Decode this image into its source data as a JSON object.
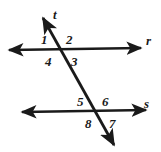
{
  "figure": {
    "kind": "geometry-diagram",
    "background_color": "#ffffff",
    "stroke_color": "#1a1a1a",
    "stroke_width": 2.6,
    "width": 161,
    "height": 152
  },
  "lines": [
    {
      "name": "line-r",
      "label": "r",
      "label_x": 146,
      "label_y": 34,
      "x1": 9,
      "y1": 50,
      "x2": 141,
      "y2": 48,
      "arrow_start": true,
      "arrow_end": true
    },
    {
      "name": "line-s",
      "label": "s",
      "label_x": 144,
      "label_y": 97,
      "x1": 22,
      "y1": 112,
      "x2": 146,
      "y2": 110,
      "arrow_start": true,
      "arrow_end": true
    },
    {
      "name": "line-t",
      "label": "t",
      "label_x": 53,
      "label_y": 8,
      "x1": 43,
      "y1": 18,
      "x2": 114,
      "y2": 145,
      "arrow_start": true,
      "arrow_end": true
    }
  ],
  "intersections": [
    {
      "name": "intersection-r-t",
      "x": 60,
      "y": 49
    },
    {
      "name": "intersection-s-t",
      "x": 97,
      "y": 111
    }
  ],
  "angles": [
    {
      "id": "1",
      "label": "1",
      "x": 41,
      "y": 33,
      "position": "upper-left-of-top-intersection"
    },
    {
      "id": "2",
      "label": "2",
      "x": 66,
      "y": 33,
      "position": "upper-right-of-top-intersection"
    },
    {
      "id": "3",
      "label": "3",
      "x": 71,
      "y": 55,
      "position": "lower-right-of-top-intersection"
    },
    {
      "id": "4",
      "label": "4",
      "x": 45,
      "y": 55,
      "position": "lower-left-of-top-intersection"
    },
    {
      "id": "5",
      "label": "5",
      "x": 77,
      "y": 95,
      "position": "upper-left-of-bottom-intersection"
    },
    {
      "id": "6",
      "label": "6",
      "x": 102,
      "y": 95,
      "position": "upper-right-of-bottom-intersection"
    },
    {
      "id": "7",
      "label": "7",
      "x": 109,
      "y": 117,
      "position": "lower-right-of-bottom-intersection"
    },
    {
      "id": "8",
      "label": "8",
      "x": 85,
      "y": 117,
      "position": "lower-left-of-bottom-intersection"
    }
  ]
}
